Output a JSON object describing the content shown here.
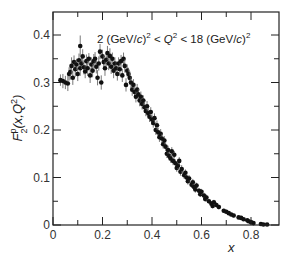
{
  "chart_data": {
    "type": "scatter",
    "title": "",
    "annotation": "2 (GeV/c)² < Q² < 18 (GeV/c)²",
    "annotation_parts": {
      "lo": "2 (GeV/",
      "c1": "c",
      "mid": ")",
      "lt1": " < ",
      "q": "Q",
      "lt2": " < 18 (GeV/",
      "c2": "c",
      "end": ")"
    },
    "xlabel": "x",
    "ylabel": "F2p(x,Q2)",
    "ylabel_parts": {
      "F": "F",
      "sup": "p",
      "sub": "2",
      "args": "(x,Q",
      "q2sup": "2",
      "close": ")"
    },
    "xlim": [
      0,
      0.915
    ],
    "ylim": [
      0,
      0.448
    ],
    "xticks_major": [
      0,
      0.2,
      0.4,
      0.6,
      0.8
    ],
    "xtick_labels": [
      "0",
      "0.2",
      "0.4",
      "0.6",
      "0.8"
    ],
    "xticks_minor": [
      0.1,
      0.3,
      0.5,
      0.7
    ],
    "yticks_major": [
      0,
      0.1,
      0.2,
      0.3,
      0.4
    ],
    "ytick_labels": [
      "0",
      "0.1",
      "0.2",
      "0.3",
      "0.4"
    ],
    "yticks_minor": [
      0.05,
      0.15,
      0.25,
      0.35
    ],
    "grid": false,
    "legend": null,
    "series": [
      {
        "name": "proton F2 data",
        "marker": "filled-circle",
        "color": "#111111",
        "points": [
          [
            0.03,
            0.305,
            0.012
          ],
          [
            0.04,
            0.303,
            0.015
          ],
          [
            0.05,
            0.3,
            0.014
          ],
          [
            0.06,
            0.298,
            0.016
          ],
          [
            0.065,
            0.318,
            0.014
          ],
          [
            0.07,
            0.322,
            0.016
          ],
          [
            0.075,
            0.335,
            0.018
          ],
          [
            0.08,
            0.31,
            0.015
          ],
          [
            0.085,
            0.343,
            0.014
          ],
          [
            0.09,
            0.328,
            0.016
          ],
          [
            0.095,
            0.338,
            0.012
          ],
          [
            0.1,
            0.318,
            0.015
          ],
          [
            0.105,
            0.347,
            0.014
          ],
          [
            0.11,
            0.377,
            0.022
          ],
          [
            0.11,
            0.33,
            0.016
          ],
          [
            0.115,
            0.34,
            0.012
          ],
          [
            0.12,
            0.355,
            0.015
          ],
          [
            0.125,
            0.332,
            0.015
          ],
          [
            0.13,
            0.323,
            0.014
          ],
          [
            0.135,
            0.345,
            0.014
          ],
          [
            0.14,
            0.33,
            0.016
          ],
          [
            0.145,
            0.35,
            0.012
          ],
          [
            0.15,
            0.315,
            0.016
          ],
          [
            0.155,
            0.338,
            0.015
          ],
          [
            0.16,
            0.325,
            0.014
          ],
          [
            0.165,
            0.345,
            0.015
          ],
          [
            0.17,
            0.35,
            0.014
          ],
          [
            0.175,
            0.333,
            0.014
          ],
          [
            0.18,
            0.31,
            0.016
          ],
          [
            0.185,
            0.34,
            0.015
          ],
          [
            0.19,
            0.365,
            0.016
          ],
          [
            0.195,
            0.3,
            0.015
          ],
          [
            0.2,
            0.355,
            0.014
          ],
          [
            0.205,
            0.343,
            0.014
          ],
          [
            0.21,
            0.33,
            0.016
          ],
          [
            0.215,
            0.348,
            0.014
          ],
          [
            0.22,
            0.362,
            0.015
          ],
          [
            0.225,
            0.34,
            0.014
          ],
          [
            0.23,
            0.356,
            0.016
          ],
          [
            0.235,
            0.333,
            0.015
          ],
          [
            0.24,
            0.35,
            0.013
          ],
          [
            0.245,
            0.325,
            0.016
          ],
          [
            0.25,
            0.34,
            0.013
          ],
          [
            0.255,
            0.33,
            0.014
          ],
          [
            0.26,
            0.318,
            0.014
          ],
          [
            0.265,
            0.34,
            0.013
          ],
          [
            0.27,
            0.328,
            0.014
          ],
          [
            0.275,
            0.345,
            0.013
          ],
          [
            0.28,
            0.315,
            0.014
          ],
          [
            0.285,
            0.35,
            0.013
          ],
          [
            0.29,
            0.335,
            0.014
          ],
          [
            0.295,
            0.295,
            0.014
          ],
          [
            0.3,
            0.325,
            0.013
          ],
          [
            0.305,
            0.318,
            0.013
          ],
          [
            0.31,
            0.31,
            0.014
          ],
          [
            0.315,
            0.3,
            0.012
          ],
          [
            0.32,
            0.285,
            0.013
          ],
          [
            0.325,
            0.295,
            0.012
          ],
          [
            0.33,
            0.28,
            0.013
          ],
          [
            0.335,
            0.27,
            0.012
          ],
          [
            0.34,
            0.285,
            0.012
          ],
          [
            0.345,
            0.275,
            0.012
          ],
          [
            0.35,
            0.262,
            0.012
          ],
          [
            0.355,
            0.27,
            0.011
          ],
          [
            0.36,
            0.255,
            0.012
          ],
          [
            0.365,
            0.262,
            0.011
          ],
          [
            0.37,
            0.248,
            0.012
          ],
          [
            0.375,
            0.24,
            0.011
          ],
          [
            0.38,
            0.25,
            0.011
          ],
          [
            0.385,
            0.235,
            0.011
          ],
          [
            0.39,
            0.228,
            0.011
          ],
          [
            0.395,
            0.238,
            0.01
          ],
          [
            0.4,
            0.222,
            0.011
          ],
          [
            0.405,
            0.215,
            0.01
          ],
          [
            0.41,
            0.225,
            0.01
          ],
          [
            0.415,
            0.2,
            0.01
          ],
          [
            0.42,
            0.21,
            0.01
          ],
          [
            0.425,
            0.195,
            0.01
          ],
          [
            0.43,
            0.185,
            0.01
          ],
          [
            0.435,
            0.192,
            0.01
          ],
          [
            0.44,
            0.182,
            0.01
          ],
          [
            0.445,
            0.17,
            0.009
          ],
          [
            0.45,
            0.178,
            0.009
          ],
          [
            0.455,
            0.165,
            0.009
          ],
          [
            0.46,
            0.15,
            0.009
          ],
          [
            0.465,
            0.158,
            0.009
          ],
          [
            0.47,
            0.145,
            0.009
          ],
          [
            0.475,
            0.14,
            0.009
          ],
          [
            0.48,
            0.155,
            0.009
          ],
          [
            0.485,
            0.135,
            0.009
          ],
          [
            0.49,
            0.148,
            0.008
          ],
          [
            0.495,
            0.13,
            0.008
          ],
          [
            0.5,
            0.12,
            0.008
          ],
          [
            0.505,
            0.125,
            0.008
          ],
          [
            0.51,
            0.135,
            0.008
          ],
          [
            0.515,
            0.112,
            0.008
          ],
          [
            0.52,
            0.118,
            0.008
          ],
          [
            0.53,
            0.105,
            0.008
          ],
          [
            0.535,
            0.11,
            0.007
          ],
          [
            0.54,
            0.1,
            0.007
          ],
          [
            0.545,
            0.092,
            0.007
          ],
          [
            0.55,
            0.098,
            0.007
          ],
          [
            0.56,
            0.085,
            0.007
          ],
          [
            0.565,
            0.09,
            0.007
          ],
          [
            0.57,
            0.08,
            0.007
          ],
          [
            0.575,
            0.075,
            0.007
          ],
          [
            0.58,
            0.083,
            0.006
          ],
          [
            0.59,
            0.072,
            0.006
          ],
          [
            0.595,
            0.065,
            0.006
          ],
          [
            0.6,
            0.07,
            0.006
          ],
          [
            0.61,
            0.062,
            0.006
          ],
          [
            0.615,
            0.055,
            0.006
          ],
          [
            0.62,
            0.058,
            0.006
          ],
          [
            0.63,
            0.05,
            0.005
          ],
          [
            0.64,
            0.045,
            0.005
          ],
          [
            0.645,
            0.04,
            0.005
          ],
          [
            0.65,
            0.048,
            0.005
          ],
          [
            0.66,
            0.042,
            0.005
          ],
          [
            0.67,
            0.038,
            0.005
          ],
          [
            0.69,
            0.03,
            0.004
          ],
          [
            0.7,
            0.028,
            0.004
          ],
          [
            0.71,
            0.025,
            0.004
          ],
          [
            0.72,
            0.022,
            0.004
          ],
          [
            0.73,
            0.02,
            0.004
          ],
          [
            0.75,
            0.016,
            0.003
          ],
          [
            0.76,
            0.015,
            0.003
          ],
          [
            0.77,
            0.012,
            0.003
          ],
          [
            0.785,
            0.01,
            0.003
          ],
          [
            0.79,
            0.008,
            0.003
          ],
          [
            0.8,
            0.006,
            0.003
          ],
          [
            0.81,
            0.004,
            0.002
          ],
          [
            0.84,
            0.002,
            0.002
          ],
          [
            0.85,
            0.001,
            0.002
          ],
          [
            0.865,
            0.001,
            0.002
          ]
        ]
      }
    ]
  }
}
